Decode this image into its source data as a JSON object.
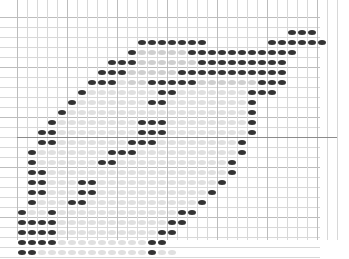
{
  "figure": {
    "title": "",
    "background_color": "#ffffff",
    "width": 349,
    "height": 259
  },
  "chart_data": {
    "type": "heatmap",
    "title": "",
    "subtitle": "",
    "xlabel": "",
    "ylabel": "",
    "grid": true,
    "legend": "none",
    "marker": {
      "shape": "ellipse",
      "width_px": 8,
      "height_px": 5
    },
    "grid_geometry": {
      "cell_size_px": 10,
      "origin_x_px": 17,
      "origin_y_px": 17,
      "cols": 32,
      "rows": 24,
      "x_range": [
        0,
        32
      ],
      "y_range": [
        0,
        24
      ]
    },
    "axis_line": {
      "orientation": "horizontal",
      "row_index": 12,
      "color": "#8c8c8c"
    },
    "value_levels": {
      "0": "#ffffff",
      "1": "#ededed",
      "2": "#e0e0e0",
      "3": "#cfcfcf",
      "4": "#b8b8b8",
      "5": "#9a9a9a",
      "6": "#7d7d7d",
      "7": "#5e5e5e",
      "8": "#3f3f3f",
      "9": "#2b2b2b"
    },
    "colors": {
      "grid_minor": "#d8d8d8",
      "grid_major": "#bdbdbd",
      "dot_dark": "#333333",
      "dot_mid": "#8a8a8a",
      "dot_light": "#e4e4e4",
      "background": "#ffffff"
    },
    "matrix": [
      [
        0,
        0,
        0,
        0,
        0,
        0,
        0,
        0,
        0,
        0,
        0,
        0,
        0,
        0,
        0,
        0,
        0,
        0,
        0,
        0,
        0,
        0,
        0,
        0,
        0,
        0,
        0,
        0,
        0,
        0,
        0,
        0
      ],
      [
        0,
        0,
        0,
        0,
        0,
        0,
        0,
        0,
        0,
        0,
        0,
        0,
        0,
        0,
        0,
        0,
        0,
        0,
        0,
        0,
        0,
        0,
        0,
        0,
        0,
        0,
        0,
        9,
        9,
        9,
        0,
        0
      ],
      [
        0,
        0,
        0,
        0,
        0,
        0,
        0,
        0,
        0,
        0,
        0,
        0,
        9,
        9,
        9,
        9,
        9,
        9,
        9,
        0,
        0,
        0,
        0,
        0,
        0,
        9,
        9,
        9,
        9,
        9,
        9,
        0
      ],
      [
        0,
        0,
        0,
        0,
        0,
        0,
        0,
        0,
        0,
        0,
        0,
        9,
        3,
        3,
        3,
        3,
        3,
        9,
        9,
        9,
        9,
        9,
        9,
        9,
        9,
        9,
        9,
        9,
        0,
        0,
        0,
        0
      ],
      [
        0,
        0,
        0,
        0,
        0,
        0,
        0,
        0,
        0,
        9,
        9,
        9,
        3,
        3,
        3,
        3,
        3,
        3,
        9,
        9,
        9,
        9,
        9,
        9,
        9,
        9,
        9,
        0,
        0,
        0,
        0,
        0
      ],
      [
        0,
        0,
        0,
        0,
        0,
        0,
        0,
        0,
        9,
        9,
        9,
        3,
        3,
        3,
        3,
        3,
        9,
        9,
        9,
        9,
        9,
        9,
        9,
        9,
        9,
        9,
        9,
        0,
        0,
        0,
        0,
        0
      ],
      [
        0,
        0,
        0,
        0,
        0,
        0,
        0,
        9,
        9,
        9,
        2,
        3,
        3,
        9,
        9,
        9,
        9,
        9,
        3,
        3,
        3,
        3,
        3,
        3,
        9,
        9,
        9,
        0,
        0,
        0,
        0,
        0
      ],
      [
        0,
        0,
        0,
        0,
        0,
        0,
        7,
        2,
        2,
        2,
        2,
        2,
        2,
        2,
        9,
        9,
        2,
        2,
        2,
        2,
        2,
        2,
        2,
        9,
        9,
        9,
        0,
        0,
        0,
        0,
        0,
        0
      ],
      [
        0,
        0,
        0,
        0,
        0,
        7,
        2,
        2,
        2,
        2,
        2,
        2,
        2,
        9,
        9,
        2,
        2,
        2,
        2,
        2,
        2,
        2,
        2,
        7,
        0,
        0,
        0,
        0,
        0,
        0,
        0,
        0
      ],
      [
        0,
        0,
        0,
        0,
        7,
        2,
        2,
        2,
        2,
        2,
        2,
        2,
        2,
        2,
        2,
        2,
        2,
        2,
        2,
        2,
        2,
        2,
        2,
        7,
        0,
        0,
        0,
        0,
        0,
        0,
        0,
        0
      ],
      [
        0,
        0,
        0,
        7,
        2,
        2,
        2,
        2,
        2,
        2,
        2,
        2,
        9,
        9,
        9,
        2,
        2,
        2,
        2,
        2,
        2,
        2,
        2,
        7,
        0,
        0,
        0,
        0,
        0,
        0,
        0,
        0
      ],
      [
        0,
        0,
        7,
        7,
        2,
        2,
        2,
        2,
        2,
        2,
        2,
        2,
        9,
        9,
        9,
        2,
        2,
        2,
        2,
        2,
        2,
        2,
        2,
        7,
        0,
        0,
        0,
        0,
        0,
        0,
        0,
        0
      ],
      [
        0,
        0,
        7,
        7,
        2,
        2,
        2,
        2,
        2,
        2,
        2,
        9,
        9,
        9,
        2,
        2,
        2,
        2,
        2,
        2,
        2,
        2,
        7,
        0,
        0,
        0,
        0,
        0,
        0,
        0,
        0,
        0
      ],
      [
        0,
        7,
        2,
        2,
        2,
        2,
        2,
        2,
        2,
        9,
        9,
        9,
        2,
        2,
        2,
        2,
        2,
        2,
        2,
        2,
        2,
        2,
        7,
        0,
        0,
        0,
        0,
        0,
        0,
        0,
        0,
        0
      ],
      [
        0,
        7,
        2,
        2,
        2,
        2,
        2,
        2,
        9,
        9,
        2,
        2,
        2,
        2,
        2,
        2,
        2,
        2,
        2,
        2,
        2,
        7,
        0,
        0,
        0,
        0,
        0,
        0,
        0,
        0,
        0,
        0
      ],
      [
        0,
        7,
        7,
        2,
        2,
        2,
        2,
        2,
        2,
        2,
        2,
        2,
        2,
        2,
        2,
        2,
        2,
        2,
        2,
        2,
        2,
        7,
        0,
        0,
        0,
        0,
        0,
        0,
        0,
        0,
        0,
        0
      ],
      [
        0,
        7,
        7,
        2,
        2,
        2,
        9,
        9,
        2,
        2,
        2,
        2,
        2,
        2,
        2,
        2,
        2,
        2,
        2,
        2,
        7,
        0,
        0,
        0,
        0,
        0,
        0,
        0,
        0,
        0,
        0,
        0
      ],
      [
        0,
        7,
        7,
        2,
        2,
        2,
        9,
        9,
        2,
        2,
        2,
        2,
        2,
        2,
        2,
        2,
        2,
        2,
        2,
        7,
        0,
        0,
        0,
        0,
        0,
        0,
        0,
        0,
        0,
        0,
        0,
        0
      ],
      [
        0,
        7,
        2,
        2,
        2,
        9,
        9,
        2,
        2,
        2,
        2,
        2,
        2,
        2,
        2,
        2,
        2,
        2,
        7,
        0,
        0,
        0,
        0,
        0,
        0,
        0,
        0,
        0,
        0,
        0,
        0,
        0
      ],
      [
        7,
        2,
        2,
        9,
        2,
        2,
        2,
        2,
        2,
        2,
        2,
        2,
        2,
        2,
        2,
        2,
        7,
        7,
        0,
        0,
        0,
        0,
        0,
        0,
        0,
        0,
        0,
        0,
        0,
        0,
        0,
        0
      ],
      [
        7,
        7,
        9,
        9,
        2,
        2,
        2,
        2,
        2,
        2,
        2,
        2,
        2,
        2,
        2,
        7,
        7,
        0,
        0,
        0,
        0,
        0,
        0,
        0,
        0,
        0,
        0,
        0,
        0,
        0,
        0,
        0
      ],
      [
        7,
        7,
        9,
        9,
        2,
        2,
        2,
        2,
        2,
        2,
        2,
        2,
        2,
        2,
        7,
        7,
        0,
        0,
        0,
        0,
        0,
        0,
        0,
        0,
        0,
        0,
        0,
        0,
        0,
        0,
        0,
        0
      ],
      [
        7,
        9,
        9,
        9,
        2,
        2,
        2,
        2,
        2,
        2,
        2,
        2,
        2,
        7,
        7,
        0,
        0,
        0,
        0,
        0,
        0,
        0,
        0,
        0,
        0,
        0,
        0,
        0,
        0,
        0,
        0,
        0
      ],
      [
        9,
        9,
        2,
        2,
        2,
        2,
        2,
        2,
        2,
        2,
        2,
        2,
        2,
        9,
        2,
        2,
        0,
        0,
        0,
        0,
        0,
        0,
        0,
        0,
        0,
        0,
        0,
        0,
        0,
        0,
        0,
        0
      ],
      [
        7,
        7,
        7,
        2,
        2,
        2,
        2,
        2,
        2,
        2,
        2,
        7,
        7,
        7,
        0,
        0,
        0,
        0,
        0,
        0,
        0,
        0,
        0,
        0,
        0,
        0,
        0,
        0,
        0,
        0,
        0,
        0
      ]
    ]
  }
}
